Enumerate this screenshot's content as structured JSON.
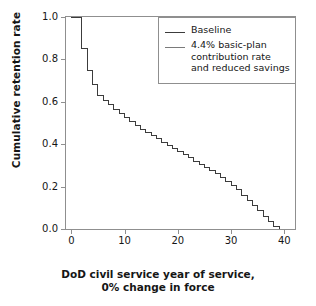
{
  "chart_data": {
    "type": "line",
    "title": "",
    "subtitle": "",
    "xlabel_line1": "DoD civil service year of service,",
    "xlabel_line2": "0% change in force",
    "ylabel": "Cumulative retention rate",
    "xlim": [
      -1,
      42
    ],
    "ylim": [
      0.0,
      1.0
    ],
    "xticks": [
      "0",
      "10",
      "20",
      "30",
      "40"
    ],
    "xtick_values": [
      0,
      10,
      20,
      30,
      40
    ],
    "yticks": [
      "0.0",
      "0.2",
      "0.4",
      "0.6",
      "0.8",
      "1.0"
    ],
    "ytick_values": [
      0.0,
      0.2,
      0.4,
      0.6,
      0.8,
      1.0
    ],
    "grid": false,
    "legend_position": "top-right",
    "step_style": "post",
    "series": [
      {
        "name": "Baseline",
        "color": "#3c3c3c",
        "x": [
          0,
          1,
          2,
          3,
          4,
          5,
          6,
          7,
          8,
          9,
          10,
          11,
          12,
          13,
          14,
          15,
          16,
          17,
          18,
          19,
          20,
          21,
          22,
          23,
          24,
          25,
          26,
          27,
          28,
          29,
          30,
          31,
          32,
          33,
          34,
          35,
          36,
          37,
          38,
          39,
          40
        ],
        "values": [
          1.0,
          1.0,
          0.85,
          0.75,
          0.68,
          0.63,
          0.605,
          0.585,
          0.565,
          0.545,
          0.525,
          0.505,
          0.49,
          0.47,
          0.455,
          0.44,
          0.425,
          0.41,
          0.395,
          0.38,
          0.365,
          0.35,
          0.335,
          0.32,
          0.305,
          0.29,
          0.275,
          0.26,
          0.245,
          0.225,
          0.205,
          0.185,
          0.16,
          0.135,
          0.11,
          0.085,
          0.06,
          0.035,
          0.012,
          0.0,
          0.0
        ]
      },
      {
        "name": "4.4% basic-plan contribution rate and reduced savings",
        "color": "#7a7a7a",
        "x": [
          0,
          1,
          2,
          3,
          4,
          5,
          6,
          7,
          8,
          9,
          10,
          11,
          12,
          13,
          14,
          15,
          16,
          17,
          18,
          19,
          20,
          21,
          22,
          23,
          24,
          25,
          26,
          27,
          28,
          29,
          30,
          31,
          32,
          33,
          34,
          35,
          36,
          37,
          38,
          39,
          40
        ],
        "values": [
          1.0,
          1.0,
          0.85,
          0.75,
          0.68,
          0.63,
          0.605,
          0.585,
          0.565,
          0.545,
          0.525,
          0.505,
          0.49,
          0.47,
          0.455,
          0.44,
          0.425,
          0.41,
          0.395,
          0.38,
          0.365,
          0.35,
          0.335,
          0.32,
          0.305,
          0.29,
          0.275,
          0.26,
          0.245,
          0.225,
          0.205,
          0.185,
          0.16,
          0.135,
          0.11,
          0.085,
          0.06,
          0.035,
          0.012,
          0.0,
          0.0
        ]
      }
    ],
    "legend_entries": [
      {
        "label": "Baseline",
        "color": "#3c3c3c"
      },
      {
        "label_line1": "4.4% basic-plan",
        "label_line2": "contribution rate",
        "label_line3": "and reduced savings",
        "color": "#7a7a7a"
      }
    ]
  }
}
